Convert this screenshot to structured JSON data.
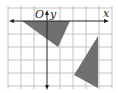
{
  "diagram": {
    "type": "coordinate-grid",
    "labels": {
      "origin": "O",
      "x_axis": "x",
      "y_axis": "y"
    },
    "grid": {
      "color": "#bdbdbd",
      "axis_color": "#222222",
      "shape_fill": "#707070"
    },
    "shapes": [
      {
        "name": "triangle-upper",
        "description": "gray triangle below x-axis near origin"
      },
      {
        "name": "triangle-lower",
        "description": "gray triangle lower right"
      }
    ]
  }
}
